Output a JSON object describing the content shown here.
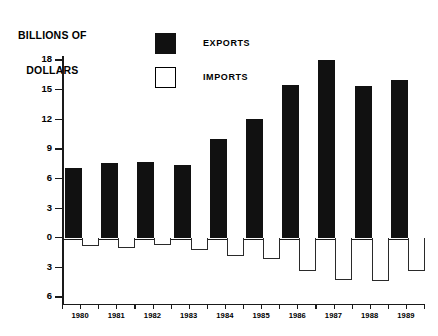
{
  "chart_data": {
    "type": "bar",
    "title": "BILLIONS OF DOLLARS",
    "title_line1": "BILLIONS OF",
    "title_line2": "DOLLARS",
    "xlabel": "",
    "ylabel": "BILLIONS OF DOLLARS",
    "ylim": [
      -6,
      18
    ],
    "grid": false,
    "legend_position": "top-center",
    "orientation": "vertical",
    "categories": [
      "1980",
      "1981",
      "1982",
      "1983",
      "1984",
      "1985",
      "1986",
      "1987",
      "1988",
      "1989"
    ],
    "ytick_values": [
      18,
      15,
      12,
      9,
      6,
      3,
      0,
      -3,
      -6
    ],
    "ytick_labels": [
      "18",
      "15",
      "12",
      "9",
      "6",
      "3",
      "0",
      "3",
      "6"
    ],
    "series": [
      {
        "name": "EXPORTS",
        "color": "#111111",
        "style": "filled",
        "values": [
          7.1,
          7.6,
          7.7,
          7.4,
          10.0,
          12.0,
          15.5,
          18.0,
          15.4,
          16.0
        ]
      },
      {
        "name": "IMPORTS",
        "color": "#ffffff",
        "style": "hollow",
        "values": [
          -0.8,
          -1.0,
          -0.7,
          -1.2,
          -1.8,
          -2.2,
          -3.4,
          -4.3,
          -4.4,
          -3.4
        ]
      }
    ]
  },
  "legend": {
    "items": [
      {
        "label": "EXPORTS",
        "swatch": "filled-square"
      },
      {
        "label": "IMPORTS",
        "swatch": "hollow-square"
      }
    ]
  }
}
